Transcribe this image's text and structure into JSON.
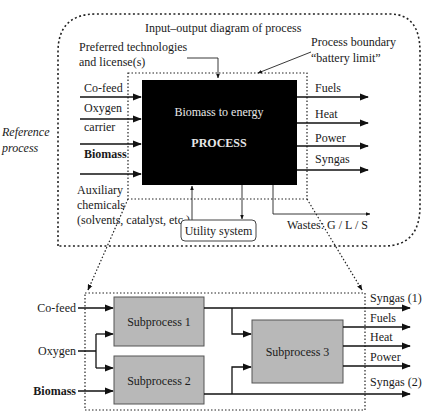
{
  "top_diagram": {
    "title": "Input–output diagram of process",
    "side_label": [
      "Reference",
      "process"
    ],
    "preferred_tech": [
      "Preferred technologies",
      "and license(s)"
    ],
    "boundary_label": [
      "Process boundary",
      "“battery limit”"
    ],
    "process_box": {
      "subtitle": "Biomass to energy",
      "title": "PROCESS",
      "fill": "#000000"
    },
    "inputs": {
      "cofeed": "Co-feed",
      "oxygen": [
        "Oxygen",
        "carrier"
      ],
      "biomass": "Biomass",
      "auxiliary": [
        "Auxiliary",
        "chemicals",
        "(solvents, catalyst, etc.)"
      ]
    },
    "outputs": [
      "Fuels",
      "Heat",
      "Power",
      "Syngas"
    ],
    "utility": "Utility system",
    "wastes": "Wastes: G / L / S"
  },
  "bottom_diagram": {
    "inputs": [
      "Co-feed",
      "Oxygen",
      "Biomass"
    ],
    "subprocesses": [
      "Subprocess 1",
      "Subprocess 2",
      "Subprocess 3"
    ],
    "subprocess_fill": "#b8b8b8",
    "outputs": [
      "Syngas (1)",
      "Fuels",
      "Heat",
      "Power",
      "Syngas (2)"
    ]
  }
}
